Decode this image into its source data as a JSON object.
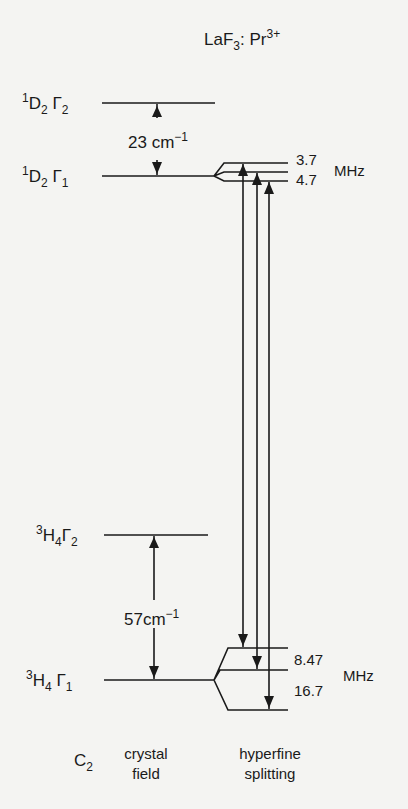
{
  "title": {
    "host": "LaF",
    "host_sub": "3",
    "sep": ":",
    "ion": "Pr",
    "ion_sup": "3+"
  },
  "levels": {
    "d2_g2": {
      "pre": "1",
      "term": "D",
      "sub": "2",
      "gamma": "Γ",
      "gsub": "2"
    },
    "d2_g1": {
      "pre": "1",
      "term": "D",
      "sub": "2",
      "gamma": "Γ",
      "gsub": "1"
    },
    "h4_g2": {
      "pre": "3",
      "term": "H",
      "sub": "4",
      "gamma": "Γ",
      "gsub": "2"
    },
    "h4_g1": {
      "pre": "3",
      "term": "H",
      "sub": "4",
      "gamma": "Γ",
      "gsub": "1"
    }
  },
  "splittings": {
    "upper_cf": {
      "value": "23",
      "unit": "cm",
      "exp": "−1"
    },
    "lower_cf": {
      "value": "57",
      "unit": "cm",
      "exp": "−1"
    },
    "upper_hf": {
      "a": "3.7",
      "b": "4.7",
      "unit": "MHz"
    },
    "lower_hf": {
      "a": "8.47",
      "b": "16.7",
      "unit": "MHz"
    }
  },
  "footer": {
    "symmetry": "C",
    "symmetry_sub": "2",
    "col1_line1": "crystal",
    "col1_line2": "field",
    "col2_line1": "hyperfine",
    "col2_line2": "splitting"
  }
}
